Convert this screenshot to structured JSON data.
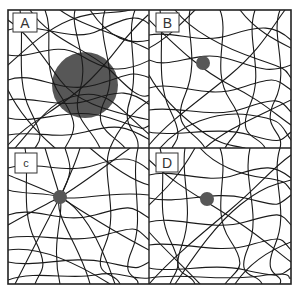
{
  "figure": {
    "frame": {
      "x": 8,
      "y": 10,
      "w": 283,
      "h": 274
    },
    "dividers": {
      "vertical_x": 149,
      "horizontal_y": 148
    },
    "panels": [
      {
        "id": "A",
        "label": "A",
        "label_box": {
          "x": 13,
          "y": 13,
          "w": 24,
          "h": 19
        },
        "particle": {
          "cx": 85,
          "cy": 85,
          "r": 33,
          "size": "large",
          "color": "#575757"
        }
      },
      {
        "id": "B",
        "label": "B",
        "label_box": {
          "x": 156,
          "y": 13,
          "w": 23,
          "h": 19
        },
        "particle": {
          "cx": 203,
          "cy": 63,
          "r": 7,
          "size": "small",
          "color": "#575757"
        }
      },
      {
        "id": "C",
        "label": "c",
        "label_box": {
          "x": 15,
          "y": 153,
          "w": 22,
          "h": 20
        },
        "particle": {
          "cx": 60,
          "cy": 197,
          "r": 7,
          "size": "small",
          "color": "#575757"
        }
      },
      {
        "id": "D",
        "label": "D",
        "label_box": {
          "x": 156,
          "y": 153,
          "w": 22,
          "h": 19
        },
        "particle": {
          "cx": 207,
          "cy": 199,
          "r": 7,
          "size": "small",
          "color": "#575757"
        }
      }
    ],
    "fiber_color": "#1a1a1a"
  }
}
